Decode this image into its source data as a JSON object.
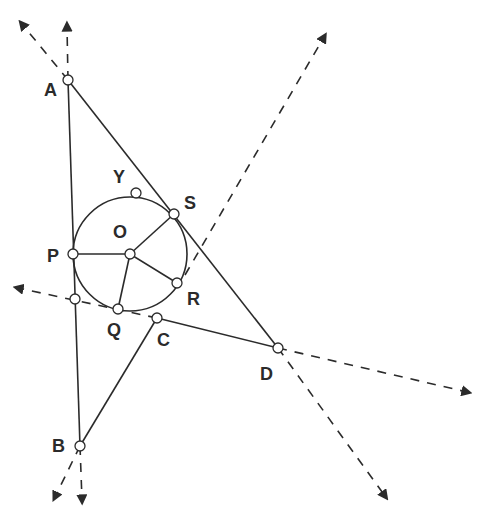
{
  "diagram": {
    "labels": {
      "A": "A",
      "B": "B",
      "C": "C",
      "D": "D",
      "O": "O",
      "P": "P",
      "Q": "Q",
      "R": "R",
      "S": "S",
      "Y": "Y"
    },
    "points": {
      "A": [
        68,
        80
      ],
      "B": [
        80,
        446
      ],
      "C": [
        157,
        318
      ],
      "D": [
        278,
        348
      ],
      "O": [
        130,
        254
      ],
      "P": [
        73,
        254
      ],
      "Q": [
        118,
        309
      ],
      "R": [
        177,
        283
      ],
      "S": [
        174,
        214
      ],
      "Y": [
        136,
        193
      ],
      "X": [
        75,
        299
      ]
    },
    "circle": {
      "center": "O",
      "radius": 57
    },
    "stroke_color": "#2b2b2b"
  }
}
